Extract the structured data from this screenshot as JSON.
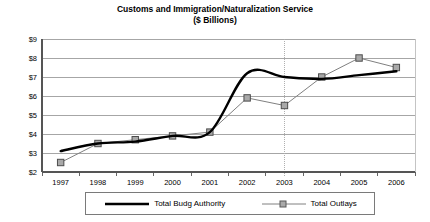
{
  "chart_data": {
    "type": "line",
    "title": "Customs and Immigration/Naturalization Service",
    "subtitle": "($ Billions)",
    "xlabel": "",
    "ylabel": "",
    "x": [
      1997,
      1998,
      1999,
      2000,
      2001,
      2002,
      2003,
      2004,
      2005,
      2006
    ],
    "categories": [
      "1997",
      "1998",
      "1999",
      "2000",
      "2001",
      "2002",
      "2003",
      "2004",
      "2005",
      "2006"
    ],
    "series": [
      {
        "name": "Total Budg Authority",
        "values": [
          3.1,
          3.5,
          3.6,
          3.9,
          4.1,
          7.2,
          7.0,
          6.9,
          7.1,
          7.3
        ],
        "color": "#000000",
        "marker": "none",
        "line_width": 2.4
      },
      {
        "name": "Total Outlays",
        "values": [
          2.5,
          3.5,
          3.7,
          3.9,
          4.1,
          5.9,
          5.5,
          7.0,
          8.0,
          7.5
        ],
        "color": "#808080",
        "marker": "square",
        "line_width": 1.0
      }
    ],
    "ylim": [
      2,
      9
    ],
    "ytick_labels": [
      "$2",
      "$3",
      "$4",
      "$5",
      "$6",
      "$7",
      "$8",
      "$9"
    ],
    "ytick_values": [
      2,
      3,
      4,
      5,
      6,
      7,
      8,
      9
    ],
    "xtick_labels": [
      "1997",
      "1998",
      "1999",
      "2000",
      "2001",
      "2002",
      "2003",
      "2004",
      "2005",
      "2006"
    ],
    "grid": true,
    "grid_color": "#909090",
    "legend_position": "bottom",
    "annotations": [
      {
        "type": "vertical-dotted-line",
        "x": 2003,
        "color": "#b0b0b0"
      }
    ]
  },
  "legend": {
    "entries": [
      {
        "label": "Total Budg Authority"
      },
      {
        "label": "Total Outlays"
      }
    ]
  }
}
